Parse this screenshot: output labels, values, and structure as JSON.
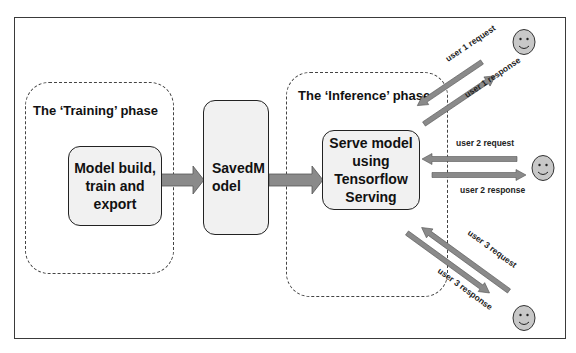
{
  "diagram": {
    "phases": [
      {
        "id": "training",
        "label": "The ‘Training’ phase"
      },
      {
        "id": "inference",
        "label": "The ‘Inference’ phase"
      }
    ],
    "nodes": [
      {
        "id": "build",
        "label": "Model build,\ntrain and\nexport"
      },
      {
        "id": "savedmodel",
        "label": "SavedM\nodel"
      },
      {
        "id": "serve",
        "label": "Serve model\nusing\nTensorflow\nServing"
      }
    ],
    "users": [
      {
        "id": "user1",
        "icon": "smiley-icon",
        "request": "user 1 request",
        "response": "user 1 response"
      },
      {
        "id": "user2",
        "icon": "smiley-icon",
        "request": "user 2 request",
        "response": "user 2 response"
      },
      {
        "id": "user3",
        "icon": "smiley-icon",
        "request": "user 3 request",
        "response": "user 3 response"
      }
    ],
    "colors": {
      "arrow": "#8a8a8a",
      "face": "#c8c8c8",
      "node_fill": "#f1f1f1"
    }
  }
}
